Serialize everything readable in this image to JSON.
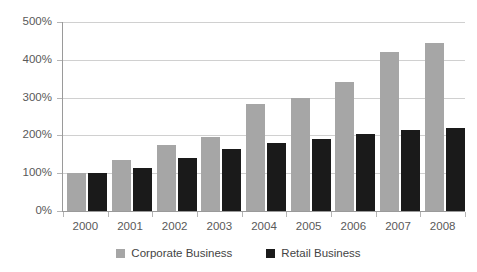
{
  "chart_data": {
    "type": "bar",
    "title": "",
    "subtitle": "",
    "xlabel": "",
    "ylabel": "",
    "ylim": [
      0,
      500
    ],
    "ytick_labels": [
      "0%",
      "100%",
      "200%",
      "300%",
      "400%",
      "500%"
    ],
    "ytick_values": [
      0,
      100,
      200,
      300,
      400,
      500
    ],
    "grid": true,
    "legend_position": "bottom",
    "categories": [
      "2000",
      "2001",
      "2002",
      "2003",
      "2004",
      "2005",
      "2006",
      "2007",
      "2008"
    ],
    "series": [
      {
        "name": "Corporate Business",
        "color": "#a6a6a6",
        "values": [
          100,
          135,
          175,
          195,
          283,
          300,
          342,
          420,
          445
        ]
      },
      {
        "name": "Retail Business",
        "color": "#1a1a1a",
        "values": [
          100,
          115,
          140,
          165,
          180,
          190,
          205,
          215,
          220
        ]
      }
    ]
  },
  "legend": {
    "items": [
      {
        "label": "Corporate Business",
        "swatch": "corporate"
      },
      {
        "label": "Retail Business",
        "swatch": "retail"
      }
    ]
  },
  "colors": {
    "corporate": "#a6a6a6",
    "retail": "#1a1a1a",
    "gridline": "#d0d0d0",
    "axis": "#9a9a9a",
    "text": "#595959",
    "background": "#ffffff"
  }
}
